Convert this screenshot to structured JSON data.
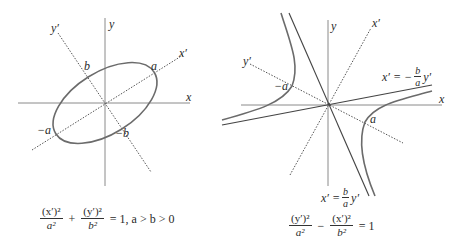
{
  "ellipse_figure": {
    "axes": {
      "x": "x",
      "y": "y",
      "x_rot": "x′",
      "y_rot": "y′"
    },
    "points": {
      "a": "a",
      "neg_a": "−a",
      "b": "b",
      "neg_b": "−b"
    },
    "equation": {
      "term1_num": "(x′)²",
      "term1_den": "a²",
      "plus": "+",
      "term2_num": "(y′)²",
      "term2_den": "b²",
      "rhs": "= 1, a > b > 0"
    },
    "colors": {
      "curve": "#6b6b6b",
      "axis": "#8a8a8a",
      "dotted": "#555555"
    }
  },
  "hyperbola_figure": {
    "axes": {
      "x": "x",
      "y": "y",
      "x_rot": "x′",
      "y_rot": "y′"
    },
    "points": {
      "a": "a",
      "neg_a": "−a"
    },
    "asymptote_upper": {
      "lhs": "x′ = −",
      "num": "b",
      "den": "a",
      "rhs": "y′"
    },
    "asymptote_lower": {
      "lhs": "x′ =",
      "num": "b",
      "den": "a",
      "rhs": "y′"
    },
    "equation": {
      "term1_num": "(y′)²",
      "term1_den": "a²",
      "minus": "−",
      "term2_num": "(x′)²",
      "term2_den": "b²",
      "rhs": "= 1"
    }
  }
}
